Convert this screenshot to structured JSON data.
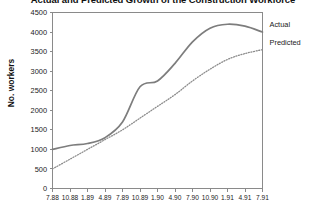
{
  "chart_data": {
    "type": "line",
    "title": "Actual and Predicted Growth of the Construction Workforce",
    "xlabel": "",
    "ylabel": "No. workers",
    "ylim": [
      0,
      4500
    ],
    "ytick_step": 500,
    "yticks": [
      "0",
      "500",
      "1000",
      "1500",
      "2000",
      "2500",
      "3000",
      "3500",
      "4000",
      "4500"
    ],
    "grid": false,
    "legend_position": "right-outside",
    "categories": [
      "7.88",
      "10.88",
      "1.89",
      "4.89",
      "7.89",
      "10.89",
      "1.90",
      "4.90",
      "7.90",
      "10.90",
      "1.91",
      "4.91",
      "7.91"
    ],
    "series": [
      {
        "name": "Actual",
        "style": "solid",
        "color": "#7d7d7d",
        "values": [
          1000,
          1100,
          1150,
          1300,
          1700,
          2600,
          2750,
          3200,
          3750,
          4100,
          4200,
          4150,
          4000
        ]
      },
      {
        "name": "Predicted",
        "style": "dotted",
        "color": "#8c8c8c",
        "values": [
          500,
          750,
          1000,
          1250,
          1500,
          1800,
          2100,
          2400,
          2750,
          3050,
          3300,
          3450,
          3550
        ]
      }
    ]
  },
  "legend": {
    "actual_label": "Actual",
    "predicted_label": "Predicted"
  }
}
